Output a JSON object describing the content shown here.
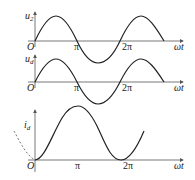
{
  "diagram": {
    "colors": {
      "curve": "#222222",
      "axis": "#555555",
      "dashed": "#666666",
      "background": "#ffffff"
    },
    "plots": [
      {
        "id": "u2",
        "ylabel_main": "u",
        "ylabel_sub": "2",
        "origin_label": "O",
        "xlabel": "ωt",
        "ticks": [
          "π",
          "2π"
        ],
        "description": "sinusoidal source voltage u2, full sine wave over ~2.3 periods"
      },
      {
        "id": "ud",
        "ylabel_main": "u",
        "ylabel_sub": "d",
        "origin_label": "O",
        "xlabel": "ωt",
        "ticks": [
          "π",
          "2π"
        ],
        "description": "output voltage ud equal to u2 (sine wave)"
      },
      {
        "id": "id",
        "ylabel_main": "i",
        "ylabel_sub": "d",
        "origin_label": "O",
        "xlabel": "ωt",
        "ticks": [
          "π",
          "2π"
        ],
        "description": "load current id, (1 - cos ωt) shape peaking at π, zero at 0 and 2π; dashed continuation before origin"
      }
    ]
  }
}
